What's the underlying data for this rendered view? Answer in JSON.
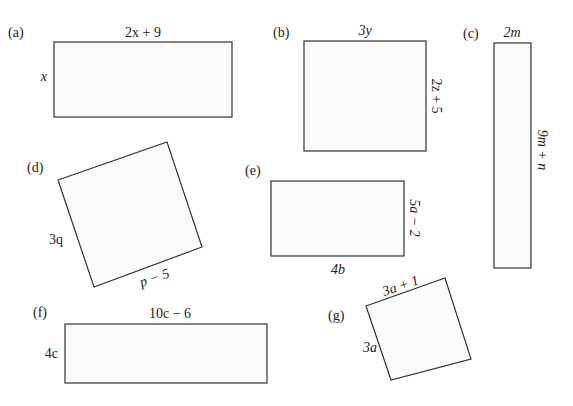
{
  "figures": [
    {
      "id": "a",
      "label": "(a)",
      "top": "2x + 9",
      "side": "x"
    },
    {
      "id": "b",
      "label": "(b)",
      "top": "3y",
      "side": "2z + 5"
    },
    {
      "id": "c",
      "label": "(c)",
      "top": "2m",
      "side": "9m + n"
    },
    {
      "id": "d",
      "label": "(d)",
      "bottom": "p − 5",
      "side": "3q"
    },
    {
      "id": "e",
      "label": "(e)",
      "bottom": "4b",
      "side": "5a − 2"
    },
    {
      "id": "f",
      "label": "(f)",
      "top": "10c − 6",
      "side": "4c"
    },
    {
      "id": "g",
      "label": "(g)",
      "top": "3a + 1",
      "side": "3a"
    }
  ]
}
